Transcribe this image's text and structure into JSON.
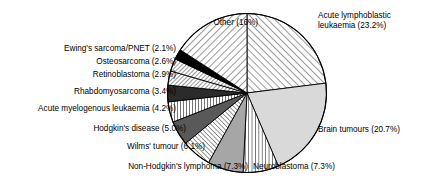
{
  "chart_data": {
    "type": "pie",
    "title": "",
    "subtitle": "",
    "xlabel": "",
    "ylabel": "",
    "legend_position": "callout-labels",
    "grid": false,
    "start_angle_deg": 0,
    "direction": "clockwise",
    "categories": [
      "Acute lymphoblastic leukaemia",
      "Brain tumours",
      "Neuroblastoma",
      "Non-Hodgkin's lymphoma",
      "Wilms' tumour",
      "Hodgkin's disease",
      "Acute myelogenous leukaemia",
      "Rhabdomyosarcoma",
      "Retinoblastoma",
      "Osteosarcoma",
      "Ewing's sarcoma/PNET",
      "Other"
    ],
    "values": [
      23.2,
      20.7,
      7.3,
      7.3,
      6.1,
      5.0,
      4.2,
      3.4,
      2.9,
      2.6,
      2.1,
      16.0
    ],
    "value_unit": "%",
    "slices": [
      {
        "label": "Acute lymphoblastic leukaemia (23.2%)",
        "name": "Acute lymphoblastic leukaemia",
        "value": 23.2,
        "pattern": "diagonal-hatch-up",
        "fill": "#ffffff"
      },
      {
        "label": "Brain tumours (20.7%)",
        "name": "Brain tumours",
        "value": 20.7,
        "pattern": "solid-light-gray",
        "fill": "#d9d9d9"
      },
      {
        "label": "Neuroblastoma (7.3%)",
        "name": "Neuroblastoma",
        "value": 7.3,
        "pattern": "vertical-lines",
        "fill": "#ffffff"
      },
      {
        "label": "Non-Hodgkin's lymphoma (7.3%)",
        "name": "Non-Hodgkin's lymphoma",
        "value": 7.3,
        "pattern": "solid-mid-gray",
        "fill": "#a6a6a6"
      },
      {
        "label": "Wilms' tumour (6.1%)",
        "name": "Wilms' tumour",
        "value": 6.1,
        "pattern": "diagonal-hatch-up",
        "fill": "#ffffff"
      },
      {
        "label": "Hodgkin's disease (5.0%)",
        "name": "Hodgkin's disease",
        "value": 5.0,
        "pattern": "solid-dark-gray",
        "fill": "#595959"
      },
      {
        "label": "Acute myelogenous leukaemia (4.2%)",
        "name": "Acute myelogenous leukaemia",
        "value": 4.2,
        "pattern": "vertical-lines",
        "fill": "#ffffff"
      },
      {
        "label": "Rhabdomyosarcoma (3.4%)",
        "name": "Rhabdomyosarcoma",
        "value": 3.4,
        "pattern": "solid-near-black",
        "fill": "#2b2b2b"
      },
      {
        "label": "Retinoblastoma (2.9%)",
        "name": "Retinoblastoma",
        "value": 2.9,
        "pattern": "diagonal-hatch-down",
        "fill": "#ffffff"
      },
      {
        "label": "Osteosarcoma (2.6%)",
        "name": "Osteosarcoma",
        "value": 2.6,
        "pattern": "diagonal-hatch-down",
        "fill": "#ffffff"
      },
      {
        "label": "Ewing's sarcoma/PNET (2.1%)",
        "name": "Ewing's sarcoma/PNET",
        "value": 2.1,
        "pattern": "solid-black",
        "fill": "#000000"
      },
      {
        "label": "Other (16%)",
        "name": "Other",
        "value": 16.0,
        "pattern": "diagonal-hatch-down",
        "fill": "#ffffff"
      }
    ]
  },
  "colors": {
    "outline": "#000000",
    "background": "#ffffff",
    "text": "#000000",
    "light_gray": "#d9d9d9",
    "mid_gray": "#a6a6a6",
    "dark_gray": "#595959",
    "near_black": "#2b2b2b",
    "black": "#000000"
  },
  "labels": {
    "other": "Other (16%)",
    "ewings": "Ewing's sarcoma/PNET (2.1%)",
    "osteosarcoma": "Osteosarcoma (2.6%)",
    "retinoblastoma": "Retinoblastoma (2.9%)",
    "rhabdomyosarcoma": "Rhabdomyosarcoma (3.4%)",
    "aml": "Acute myelogenous leukaemia (4.2%)",
    "hodgkins": "Hodgkin's disease (5.0%)",
    "wilms": "Wilms' tumour (6.1%)",
    "nhl": "Non-Hodgkin's lymphoma (7.3%)",
    "neuroblastoma": "Neuroblastoma (7.3%)",
    "brain": "Brain tumours (20.7%)",
    "all_line1": "Acute lymphoblastic",
    "all_line2": "leukaemia (23.2%)"
  }
}
